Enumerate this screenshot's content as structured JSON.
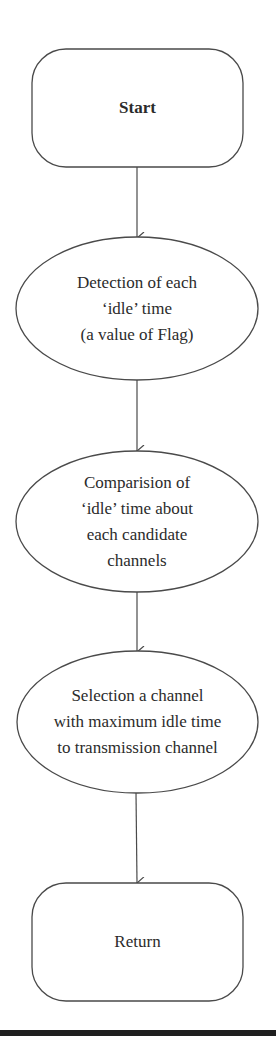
{
  "diagram": {
    "type": "flowchart",
    "direction": "top-to-bottom",
    "colors": {
      "stroke": "#4a4a4a",
      "text": "#2b2b2b",
      "background": "#ffffff",
      "rule": "#1f1f1f"
    },
    "nodes": [
      {
        "id": "start",
        "shape": "rounded-rectangle",
        "lines": [
          "Start"
        ],
        "bold": true
      },
      {
        "id": "detect",
        "shape": "ellipse",
        "lines": [
          "Detection of each",
          "‘idle’ time",
          "(a value of Flag)"
        ]
      },
      {
        "id": "compare",
        "shape": "ellipse",
        "lines": [
          "Comparision of",
          "‘idle’ time about",
          "each candidate",
          "channels"
        ]
      },
      {
        "id": "select",
        "shape": "ellipse",
        "lines": [
          "Selection a channel",
          "with maximum idle time",
          "to transmission channel"
        ]
      },
      {
        "id": "return",
        "shape": "rounded-rectangle",
        "lines": [
          "Return"
        ],
        "bold": false
      }
    ],
    "edges": [
      {
        "from": "start",
        "to": "detect"
      },
      {
        "from": "detect",
        "to": "compare"
      },
      {
        "from": "compare",
        "to": "select"
      },
      {
        "from": "select",
        "to": "return"
      }
    ]
  }
}
